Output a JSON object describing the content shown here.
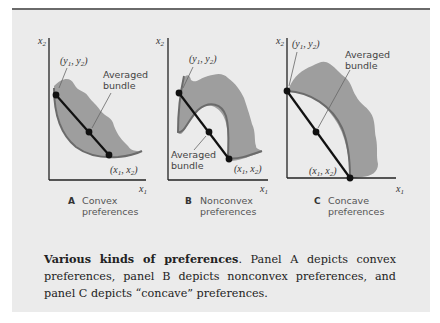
{
  "figure": {
    "panels": [
      {
        "id": "A",
        "letter": "A",
        "title_line1": "Convex",
        "title_line2": "preferences",
        "x_axis_label": "x1",
        "y_axis_label": "x2",
        "point_y_label": "(y1, y2)",
        "point_x_label": "(x1, x2)",
        "averaged_label_line1": "Averaged",
        "averaged_label_line2": "bundle"
      },
      {
        "id": "B",
        "letter": "B",
        "title_line1": "Nonconvex",
        "title_line2": "preferences",
        "x_axis_label": "x1",
        "y_axis_label": "x2",
        "point_y_label": "(y1, y2)",
        "point_x_label": "(x1, x2)",
        "averaged_label_line1": "Averaged",
        "averaged_label_line2": "bundle"
      },
      {
        "id": "C",
        "letter": "C",
        "title_line1": "Concave",
        "title_line2": "preferences",
        "x_axis_label": "x1",
        "y_axis_label": "x2",
        "point_y_label": "(y1, y2)",
        "point_x_label": "(x1, x2)",
        "averaged_label_line1": "Averaged",
        "averaged_label_line2": "bundle"
      }
    ],
    "colors": {
      "background": "#ebebeb",
      "shade": "#9e9e9e",
      "curve": "#6b6b6b",
      "line": "#111111"
    }
  },
  "caption": {
    "title": "Various kinds of preferences",
    "body": ". Panel A depicts convex preferences, panel B depicts nonconvex preferences, and panel C depicts “concave” preferences."
  }
}
